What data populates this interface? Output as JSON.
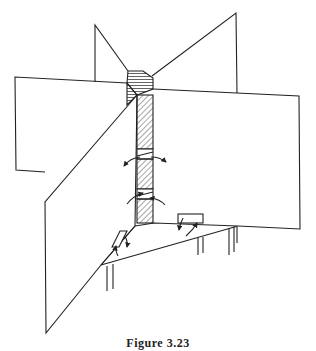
{
  "figure": {
    "caption": "Figure 3.23"
  },
  "colors": {
    "line": "#222222",
    "background": "#ffffff"
  }
}
